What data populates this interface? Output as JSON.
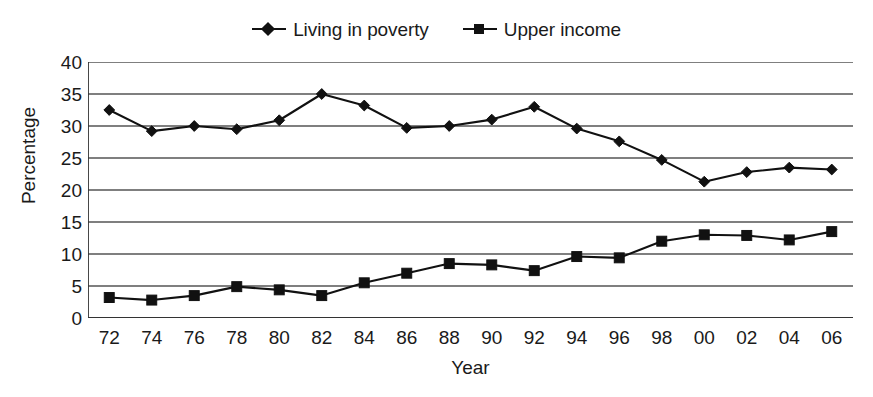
{
  "chart_data": {
    "type": "line",
    "title": "",
    "xlabel": "Year",
    "ylabel": "Percentage",
    "categories": [
      "72",
      "74",
      "76",
      "78",
      "80",
      "82",
      "84",
      "86",
      "88",
      "90",
      "92",
      "94",
      "96",
      "98",
      "00",
      "02",
      "04",
      "06"
    ],
    "x_tick_labels": [
      "72",
      "74",
      "76",
      "78",
      "80",
      "82",
      "84",
      "86",
      "88",
      "90",
      "92",
      "94",
      "96",
      "98",
      "00",
      "02",
      "04",
      "06"
    ],
    "y_tick_labels": [
      "0",
      "5",
      "10",
      "15",
      "20",
      "25",
      "30",
      "35",
      "40"
    ],
    "y_ticks": [
      0,
      5,
      10,
      15,
      20,
      25,
      30,
      35,
      40
    ],
    "ylim": [
      0,
      40
    ],
    "grid": "horizontal",
    "legend_position": "top-center",
    "series": [
      {
        "name": "Living in poverty",
        "marker": "diamond",
        "color": "#111111",
        "values": [
          32.5,
          29.2,
          30.0,
          29.5,
          30.9,
          35.0,
          33.2,
          29.7,
          30.0,
          31.0,
          33.0,
          29.6,
          27.6,
          24.7,
          21.3,
          22.8,
          23.5,
          23.2
        ]
      },
      {
        "name": "Upper income",
        "marker": "square",
        "color": "#111111",
        "values": [
          3.2,
          2.8,
          3.5,
          4.9,
          4.4,
          3.5,
          5.5,
          7.0,
          8.5,
          8.3,
          7.4,
          9.6,
          9.4,
          12.0,
          13.0,
          12.9,
          12.2,
          13.5
        ]
      }
    ]
  },
  "legend": {
    "entries": [
      {
        "label": "Living in poverty",
        "marker": "diamond"
      },
      {
        "label": "Upper income",
        "marker": "square"
      }
    ]
  },
  "axes": {
    "x_title": "Year",
    "y_title": "Percentage"
  },
  "colors": {
    "series": "#111111",
    "gridline": "#555555",
    "axis": "#333333",
    "background": "#ffffff"
  }
}
